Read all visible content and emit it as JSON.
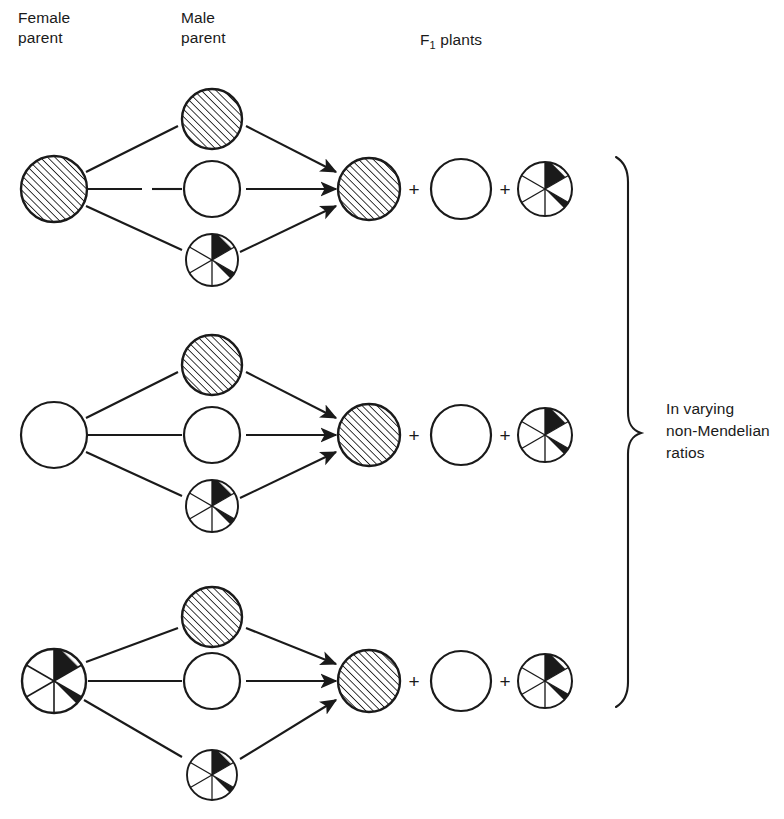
{
  "headers": {
    "female_parent": "Female\nparent",
    "male_parent": "Male\nparent",
    "f1_prefix": "F",
    "f1_subscript": "1",
    "f1_suffix": " plants"
  },
  "annotation": {
    "brace_label": "In varying\nnon-Mendelian\nratios"
  },
  "symbols": {
    "plus": "+"
  },
  "colors": {
    "ink": "#1a1a1a",
    "background": "#ffffff",
    "hatch": "#1a1a1a"
  },
  "legend": {
    "hatched": "hatched-circle",
    "white": "white-circle",
    "sectored": "sectored-variegated-circle"
  },
  "crosses": [
    {
      "row": 1,
      "female_parent": "hatched",
      "male_parents": [
        "hatched",
        "white",
        "sectored"
      ],
      "f1_offspring": [
        "hatched",
        "white",
        "sectored"
      ]
    },
    {
      "row": 2,
      "female_parent": "white",
      "male_parents": [
        "hatched",
        "white",
        "sectored"
      ],
      "f1_offspring": [
        "hatched",
        "white",
        "sectored"
      ]
    },
    {
      "row": 3,
      "female_parent": "sectored",
      "male_parents": [
        "hatched",
        "white",
        "sectored"
      ],
      "f1_offspring": [
        "hatched",
        "white",
        "sectored"
      ]
    }
  ]
}
